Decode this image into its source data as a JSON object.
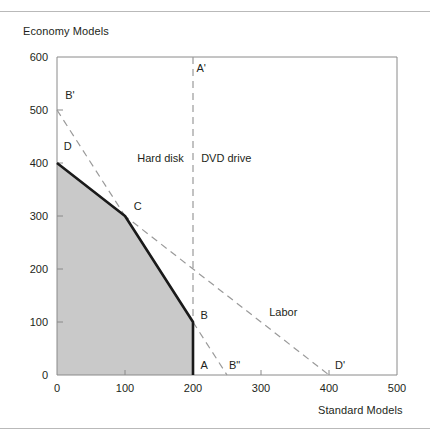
{
  "figure": {
    "y_axis_title": "Economy Models",
    "x_axis_title": "Standard Models"
  },
  "chart_data": {
    "type": "line",
    "title": "",
    "xlabel": "Standard Models",
    "ylabel": "Economy Models",
    "xlim": [
      0,
      500
    ],
    "ylim": [
      0,
      600
    ],
    "xticks": [
      0,
      100,
      200,
      300,
      400,
      500
    ],
    "yticks": [
      0,
      100,
      200,
      300,
      400,
      500,
      600
    ],
    "grid": false,
    "legend": "none",
    "xtick_labels": [
      "0",
      "100",
      "200",
      "300",
      "400",
      "500"
    ],
    "ytick_labels": [
      "0",
      "100",
      "200",
      "300",
      "400",
      "500",
      "600"
    ],
    "series": [
      {
        "name": "Production possibility frontier",
        "style": "solid-bold",
        "points": [
          [
            0,
            400
          ],
          [
            100,
            300
          ],
          [
            200,
            100
          ],
          [
            200,
            0
          ]
        ]
      },
      {
        "name": "Hard disk",
        "style": "dashed",
        "points": [
          [
            0,
            500
          ],
          [
            100,
            300
          ],
          [
            250,
            0
          ]
        ]
      },
      {
        "name": "DVD drive",
        "style": "dashed",
        "points": [
          [
            200,
            600
          ],
          [
            200,
            0
          ]
        ]
      },
      {
        "name": "Labor",
        "style": "dashed",
        "points": [
          [
            0,
            400
          ],
          [
            400,
            0
          ]
        ]
      }
    ],
    "shaded_region": {
      "name": "feasible-region",
      "color": "#c9c9c9",
      "points": [
        [
          0,
          0
        ],
        [
          0,
          400
        ],
        [
          100,
          300
        ],
        [
          200,
          100
        ],
        [
          200,
          0
        ]
      ]
    },
    "constraint_labels": [
      {
        "name": "hard-disk",
        "text": "Hard disk",
        "x": 118,
        "y": 410
      },
      {
        "name": "dvd-drive",
        "text": "DVD drive",
        "x": 212,
        "y": 410
      },
      {
        "name": "labor",
        "text": "Labor",
        "x": 312,
        "y": 118
      }
    ],
    "point_labels": [
      {
        "name": "A-prime",
        "text": "A'",
        "x": 205,
        "y": 580
      },
      {
        "name": "B-prime",
        "text": "B'",
        "x": 12,
        "y": 528
      },
      {
        "name": "D",
        "text": "D",
        "x": 10,
        "y": 432
      },
      {
        "name": "C",
        "text": "C",
        "x": 113,
        "y": 318
      },
      {
        "name": "B",
        "text": "B",
        "x": 211,
        "y": 113
      },
      {
        "name": "A",
        "text": "A",
        "x": 211,
        "y": 18
      },
      {
        "name": "B-dprime",
        "text": "B\"",
        "x": 253,
        "y": 18
      },
      {
        "name": "D-prime",
        "text": "D'",
        "x": 409,
        "y": 18
      }
    ]
  }
}
